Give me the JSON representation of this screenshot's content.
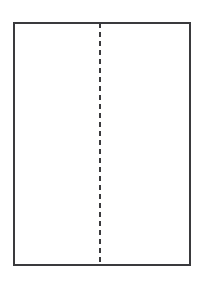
{
  "canvas": {
    "width_px": 205,
    "height_px": 284,
    "background_color": "#ffffff"
  },
  "diagram": {
    "type": "schematic",
    "description": "Plain rectangle outline with a single dashed vertical line running down its interior, slightly left of centre.",
    "shapes": [
      {
        "name": "outer-rectangle",
        "kind": "rectangle",
        "x_px": 13,
        "y_px": 22,
        "width_px": 178,
        "height_px": 244,
        "stroke_color": "#3a3a3d",
        "stroke_width_px": 2,
        "stroke_style": "solid",
        "fill_color": "#ffffff"
      },
      {
        "name": "center-dashed-line",
        "kind": "line",
        "orientation": "vertical",
        "x_px": 100,
        "y_start_px": 23,
        "y_end_px": 265,
        "stroke_color": "#3a3a3d",
        "stroke_width_px": 2,
        "stroke_style": "dashed",
        "dash_length_px": 5.5,
        "gap_length_px": 3.5
      }
    ],
    "labels": []
  }
}
